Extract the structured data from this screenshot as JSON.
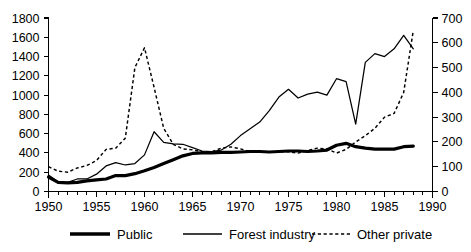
{
  "chart_data": {
    "type": "line",
    "title": "",
    "subtitle": "",
    "xlabel": "",
    "ylabel": "",
    "y2label": "",
    "grid": false,
    "legend_position": "bottom",
    "xlim": [
      1950,
      1990
    ],
    "ylim": [
      0,
      1800
    ],
    "y2lim": [
      0,
      700
    ],
    "x_ticks_major": [
      1950,
      1955,
      1960,
      1965,
      1970,
      1975,
      1980,
      1985,
      1990
    ],
    "x_tick_labels": [
      "1950",
      "1955",
      "1960",
      "1965",
      "1970",
      "1975",
      "1980",
      "1985",
      "1990"
    ],
    "x_minor_tick_step": 1,
    "y_ticks": [
      0,
      200,
      400,
      600,
      800,
      1000,
      1200,
      1400,
      1600,
      1800
    ],
    "y_tick_labels": [
      "0",
      "200",
      "400",
      "600",
      "800",
      "1000",
      "1200",
      "1400",
      "1600",
      "1800"
    ],
    "y2_ticks": [
      0,
      100,
      200,
      300,
      400,
      500,
      600,
      700
    ],
    "y2_tick_labels": [
      "0",
      "100",
      "200",
      "300",
      "400",
      "500",
      "600",
      "700"
    ],
    "x": [
      1950,
      1951,
      1952,
      1953,
      1954,
      1955,
      1956,
      1957,
      1958,
      1959,
      1960,
      1961,
      1962,
      1963,
      1964,
      1965,
      1966,
      1967,
      1968,
      1969,
      1970,
      1971,
      1972,
      1973,
      1974,
      1975,
      1976,
      1977,
      1978,
      1979,
      1980,
      1981,
      1982,
      1983,
      1984,
      1985,
      1986,
      1987,
      1988
    ],
    "series": [
      {
        "name": "Public",
        "axis": "left",
        "style": "thick-solid",
        "color": "#000000",
        "values": [
          150,
          95,
          90,
          95,
          110,
          120,
          130,
          165,
          165,
          185,
          215,
          250,
          290,
          330,
          370,
          395,
          400,
          400,
          405,
          405,
          410,
          415,
          415,
          410,
          415,
          420,
          420,
          415,
          420,
          430,
          480,
          500,
          465,
          450,
          440,
          440,
          440,
          465,
          470
        ]
      },
      {
        "name": "Forest industry",
        "axis": "left",
        "style": "thin-solid",
        "color": "#000000",
        "values": [
          170,
          100,
          95,
          130,
          130,
          180,
          265,
          300,
          275,
          290,
          380,
          620,
          510,
          495,
          490,
          455,
          420,
          415,
          430,
          490,
          580,
          650,
          720,
          840,
          980,
          1060,
          970,
          1010,
          1030,
          1000,
          1170,
          1140,
          700,
          1340,
          1430,
          1400,
          1480,
          1620,
          1480
        ]
      },
      {
        "name": "Other private",
        "axis": "right",
        "style": "dashed",
        "color": "#000000",
        "values": [
          100,
          82,
          78,
          95,
          105,
          125,
          170,
          175,
          215,
          500,
          580,
          420,
          255,
          190,
          172,
          168,
          160,
          160,
          175,
          180,
          172,
          160,
          158,
          160,
          160,
          160,
          155,
          165,
          175,
          172,
          155,
          170,
          200,
          225,
          255,
          300,
          315,
          400,
          650
        ]
      }
    ],
    "legend": [
      {
        "label": "Public",
        "style": "thick-solid"
      },
      {
        "label": "Forest industry",
        "style": "thin-solid"
      },
      {
        "label": "Other private",
        "style": "dashed"
      }
    ]
  }
}
